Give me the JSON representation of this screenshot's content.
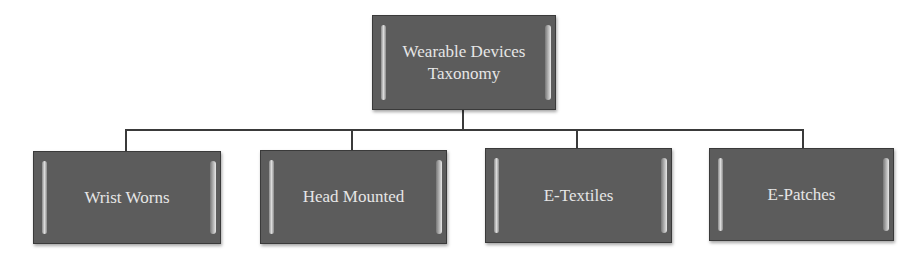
{
  "diagram": {
    "type": "tree",
    "root": {
      "label_line1": "Wearable Devices",
      "label_line2": "Taxonomy"
    },
    "children": [
      {
        "label": "Wrist Worns"
      },
      {
        "label": "Head Mounted"
      },
      {
        "label": "E-Textiles"
      },
      {
        "label": "E-Patches"
      }
    ],
    "colors": {
      "node_fill": "#5c5c5c",
      "node_text": "#e6e6e6",
      "connector": "#3a3a3a",
      "background": "#ffffff"
    }
  }
}
